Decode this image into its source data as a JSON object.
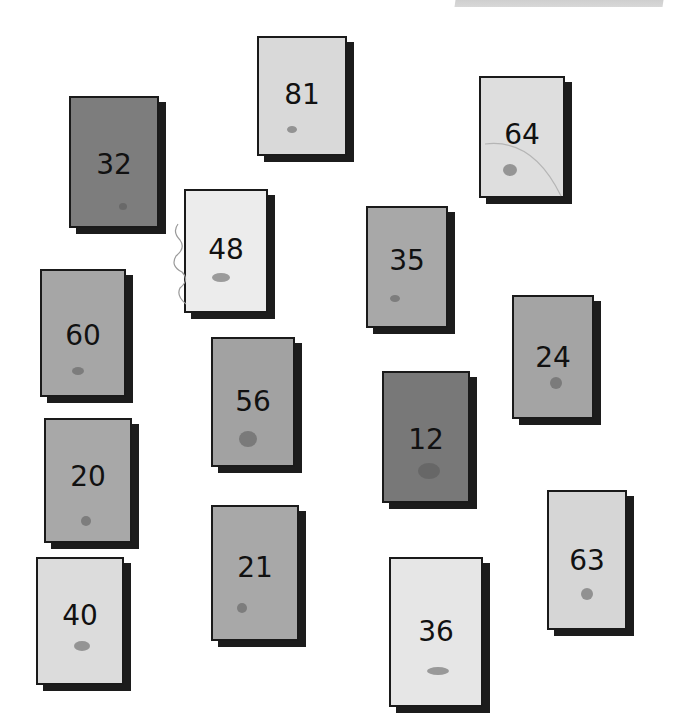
{
  "scene": {
    "description": "Hand-drawn rectangular cards, each with a number and a small mark, scattered on white paper",
    "background_color": "#ffffff",
    "cards": [
      {
        "number": "81",
        "x": 257,
        "y": 36,
        "w": 90,
        "h": 120,
        "fill": "#d9d9d9",
        "num_top": 40,
        "mark": {
          "x": 28,
          "y": 88,
          "w": 10,
          "h": 7
        }
      },
      {
        "number": "32",
        "x": 69,
        "y": 96,
        "w": 90,
        "h": 132,
        "fill": "#7d7d7d",
        "num_top": 50,
        "mark": {
          "x": 48,
          "y": 105,
          "w": 8,
          "h": 7
        }
      },
      {
        "number": "64",
        "x": 479,
        "y": 76,
        "w": 86,
        "h": 122,
        "fill": "#dedede",
        "num_top": 40,
        "mark": {
          "x": 22,
          "y": 86,
          "w": 14,
          "h": 12
        }
      },
      {
        "number": "48",
        "x": 184,
        "y": 189,
        "w": 84,
        "h": 124,
        "fill": "#ececec",
        "num_top": 42,
        "mark": {
          "x": 26,
          "y": 82,
          "w": 18,
          "h": 9
        }
      },
      {
        "number": "35",
        "x": 366,
        "y": 206,
        "w": 82,
        "h": 122,
        "fill": "#a8a8a8",
        "num_top": 36,
        "mark": {
          "x": 22,
          "y": 87,
          "w": 10,
          "h": 7
        }
      },
      {
        "number": "60",
        "x": 40,
        "y": 269,
        "w": 86,
        "h": 128,
        "fill": "#a6a6a6",
        "num_top": 48,
        "mark": {
          "x": 30,
          "y": 96,
          "w": 12,
          "h": 8
        }
      },
      {
        "number": "24",
        "x": 512,
        "y": 295,
        "w": 82,
        "h": 124,
        "fill": "#a4a4a4",
        "num_top": 44,
        "mark": {
          "x": 36,
          "y": 80,
          "w": 12,
          "h": 12
        }
      },
      {
        "number": "56",
        "x": 211,
        "y": 337,
        "w": 84,
        "h": 130,
        "fill": "#a2a2a2",
        "num_top": 46,
        "mark": {
          "x": 26,
          "y": 92,
          "w": 18,
          "h": 16
        }
      },
      {
        "number": "12",
        "x": 382,
        "y": 371,
        "w": 88,
        "h": 132,
        "fill": "#787878",
        "num_top": 50,
        "mark": {
          "x": 34,
          "y": 90,
          "w": 22,
          "h": 16
        }
      },
      {
        "number": "20",
        "x": 44,
        "y": 418,
        "w": 88,
        "h": 125,
        "fill": "#a8a8a8",
        "num_top": 40,
        "mark": {
          "x": 35,
          "y": 96,
          "w": 10,
          "h": 10
        }
      },
      {
        "number": "21",
        "x": 211,
        "y": 505,
        "w": 88,
        "h": 136,
        "fill": "#a8a8a8",
        "num_top": 44,
        "mark": {
          "x": 24,
          "y": 96,
          "w": 10,
          "h": 10
        }
      },
      {
        "number": "63",
        "x": 547,
        "y": 490,
        "w": 80,
        "h": 140,
        "fill": "#d6d6d6",
        "num_top": 52,
        "mark": {
          "x": 32,
          "y": 96,
          "w": 12,
          "h": 12
        }
      },
      {
        "number": "40",
        "x": 36,
        "y": 557,
        "w": 88,
        "h": 128,
        "fill": "#dcdcdc",
        "num_top": 40,
        "mark": {
          "x": 36,
          "y": 82,
          "w": 16,
          "h": 10
        }
      },
      {
        "number": "36",
        "x": 389,
        "y": 557,
        "w": 94,
        "h": 150,
        "fill": "#e6e6e6",
        "num_top": 56,
        "mark": {
          "x": 36,
          "y": 108,
          "w": 22,
          "h": 8
        }
      }
    ]
  }
}
